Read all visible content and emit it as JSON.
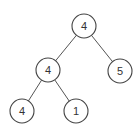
{
  "tree": {
    "nodes": [
      {
        "id": "root",
        "value": "4",
        "cx": 84,
        "cy": 26
      },
      {
        "id": "left",
        "value": "4",
        "cx": 48,
        "cy": 70
      },
      {
        "id": "right",
        "value": "5",
        "cx": 120,
        "cy": 71
      },
      {
        "id": "left-left",
        "value": "4",
        "cx": 22,
        "cy": 111
      },
      {
        "id": "left-right",
        "value": "1",
        "cx": 76,
        "cy": 111
      }
    ],
    "edges": [
      {
        "from": "root",
        "to": "left"
      },
      {
        "from": "root",
        "to": "right"
      },
      {
        "from": "left",
        "to": "left-left"
      },
      {
        "from": "left",
        "to": "left-right"
      }
    ],
    "radius": 12
  }
}
